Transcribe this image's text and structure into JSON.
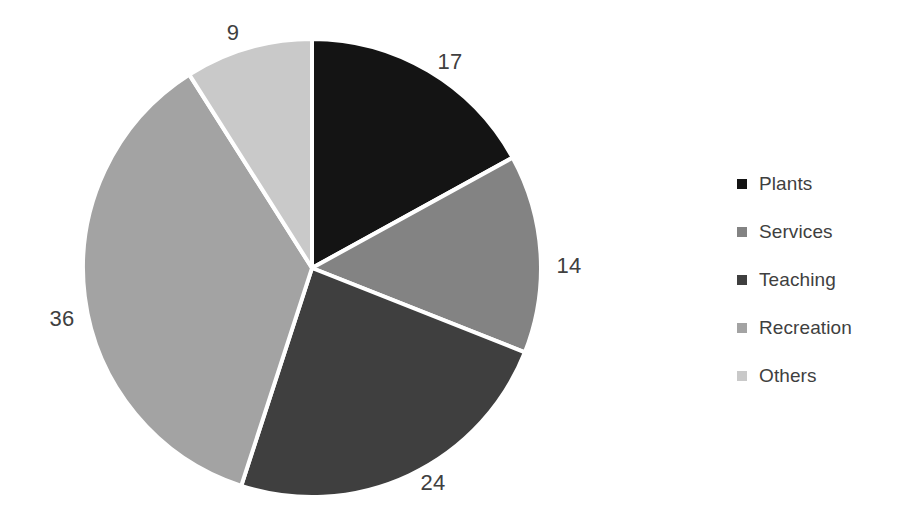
{
  "chart_data": {
    "type": "pie",
    "title": "",
    "labels": [
      "Plants",
      "Services",
      "Teaching",
      "Recreation",
      "Others"
    ],
    "values": [
      17,
      14,
      24,
      36,
      9
    ],
    "total": 100,
    "colors": [
      "#141414",
      "#838383",
      "#3f3f3f",
      "#a3a3a3",
      "#c9c9c9"
    ],
    "start_angle_deg": 0,
    "direction": "clockwise",
    "slice_border_color": "#ffffff",
    "slice_border_width": 4,
    "background": "#ffffff",
    "legend": {
      "position": "right",
      "entries": [
        {
          "label": "Plants",
          "color": "#141414"
        },
        {
          "label": "Services",
          "color": "#838383"
        },
        {
          "label": "Teaching",
          "color": "#3f3f3f"
        },
        {
          "label": "Recreation",
          "color": "#a3a3a3"
        },
        {
          "label": "Others",
          "color": "#c9c9c9"
        }
      ]
    },
    "data_labels": [
      {
        "text": "17",
        "value": 17,
        "series": "Plants",
        "x": 450,
        "y": 62
      },
      {
        "text": "14",
        "value": 14,
        "series": "Services",
        "x": 569,
        "y": 266
      },
      {
        "text": "24",
        "value": 24,
        "series": "Teaching",
        "x": 433,
        "y": 483
      },
      {
        "text": "36",
        "value": 36,
        "series": "Recreation",
        "x": 62,
        "y": 319
      },
      {
        "text": "9",
        "value": 9,
        "series": "Others",
        "x": 233,
        "y": 33
      }
    ],
    "geometry": {
      "cx": 312,
      "cy": 268,
      "r": 229
    }
  }
}
